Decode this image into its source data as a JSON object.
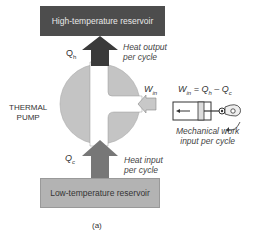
{
  "reservoirs": {
    "high": "High-temperature reservoir",
    "low": "Low-temperature reservoir"
  },
  "pump_label_line1": "THERMAL",
  "pump_label_line2": "PUMP",
  "labels": {
    "qh": "Q",
    "qh_sub": "h",
    "qc": "Q",
    "qc_sub": "c",
    "win": "W",
    "win_sub": "in"
  },
  "annotations": {
    "heat_output_1": "Heat output",
    "heat_output_2": "per cycle",
    "heat_input_1": "Heat input",
    "heat_input_2": "per cycle",
    "mech_work_1": "Mechanical work",
    "mech_work_2": "input per cycle"
  },
  "equation": {
    "w": "W",
    "w_sub": "in",
    "eq": " = Q",
    "qh_sub": "h",
    "minus": " – Q",
    "qc_sub": "c"
  },
  "caption": "(a)",
  "colors": {
    "hot": "#4d4d4d",
    "cold": "#b3b3b3",
    "pump": "#c4c4c4",
    "arrow_up_dark": "#3a3a3a",
    "arrow_up_mid": "#777777",
    "win_arrow": "#c8c8c8"
  }
}
